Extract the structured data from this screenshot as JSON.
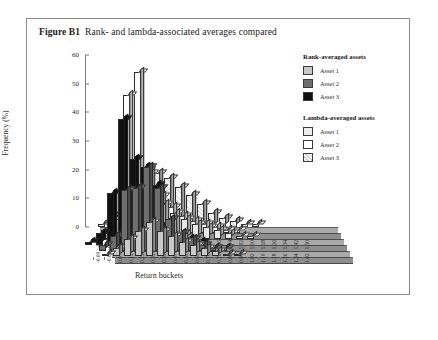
{
  "figure": {
    "label": "Figure B1",
    "caption": "Rank- and lambda-associated averages compared"
  },
  "chart_data": {
    "type": "bar",
    "title": "Rank- and lambda-associated averages compared",
    "xlabel": "Return buckets",
    "ylabel": "Frequency (%)",
    "ylim": [
      0,
      60
    ],
    "yticks": [
      0,
      10,
      20,
      30,
      40,
      50,
      60
    ],
    "grid": false,
    "legend_position": "right",
    "categories": [
      "-0.09 : -0.03",
      "-0.03 : 0.07",
      "0.07 : 0.15",
      "0.15 : 0.21",
      "0.23 : 0.31",
      "0.31 : 0.39",
      "0.39 : 0.47",
      "0.47 : 0.55",
      "0.55 : 0.61",
      "0.63 : 0.70",
      "0.70 : 0.78",
      "0.78 : 0.86",
      "0.86 : 0.94",
      "0.94 : 1.02",
      "1.02 : 1.10",
      "1.10 : 1.18",
      "1.18 : 1.26",
      "1.26 : 1.34",
      "1.34 : 1.42",
      "1.42 : 1.50"
    ],
    "series": [
      {
        "name": "Asset 1",
        "group": "Rank-averaged assets",
        "color": "#c9c9c9",
        "values": [
          0,
          1,
          3,
          6,
          9,
          12,
          9,
          7,
          5,
          4,
          3,
          2,
          1,
          1,
          0,
          0,
          0,
          0,
          0,
          0
        ]
      },
      {
        "name": "Asset 2",
        "group": "Rank-averaged assets",
        "color": "#6e6e6e",
        "values": [
          0,
          2,
          5,
          21,
          22,
          29,
          22,
          11,
          6,
          4,
          2,
          1,
          1,
          0,
          0,
          0,
          0,
          0,
          0,
          0
        ]
      },
      {
        "name": "Asset 3",
        "group": "Rank-averaged assets",
        "color": "#111111",
        "values": [
          1,
          4,
          18,
          44,
          30,
          27,
          21,
          8,
          3,
          2,
          1,
          0,
          0,
          0,
          0,
          0,
          0,
          0,
          0,
          0
        ]
      },
      {
        "name": "Asset 1",
        "group": "Lambda-averaged assets",
        "color": "#e8e8e8",
        "values": [
          0,
          0,
          2,
          7,
          15,
          19,
          16,
          12,
          9,
          7,
          5,
          4,
          3,
          2,
          1,
          1,
          0,
          0,
          0,
          0
        ]
      },
      {
        "name": "Asset 2",
        "group": "Lambda-averaged assets",
        "color": "#fdfdfd",
        "values": [
          0,
          0,
          1,
          6,
          48,
          56,
          21,
          13,
          9,
          6,
          4,
          3,
          2,
          1,
          1,
          0,
          0,
          0,
          0,
          0
        ]
      },
      {
        "name": "Asset 3",
        "group": "Lambda-averaged assets",
        "color": "#dedede",
        "values": [
          0,
          0,
          1,
          4,
          10,
          14,
          20,
          19,
          17,
          14,
          11,
          8,
          5,
          3,
          2,
          1,
          1,
          0,
          0,
          0
        ]
      }
    ]
  },
  "legend": {
    "groups": [
      {
        "title": "Rank-averaged assets",
        "items": [
          {
            "label": "Asset 1",
            "color": "#c9c9c9"
          },
          {
            "label": "Asset 2",
            "color": "#6e6e6e"
          },
          {
            "label": "Asset 3",
            "color": "#111111"
          }
        ]
      },
      {
        "title": "Lambda-averaged assets",
        "items": [
          {
            "label": "Asset 1",
            "color": "#ededed"
          },
          {
            "label": "Asset 2",
            "color": "#ffffff"
          },
          {
            "label": "Asset 3",
            "color": "#e0e0e0"
          }
        ]
      }
    ]
  }
}
